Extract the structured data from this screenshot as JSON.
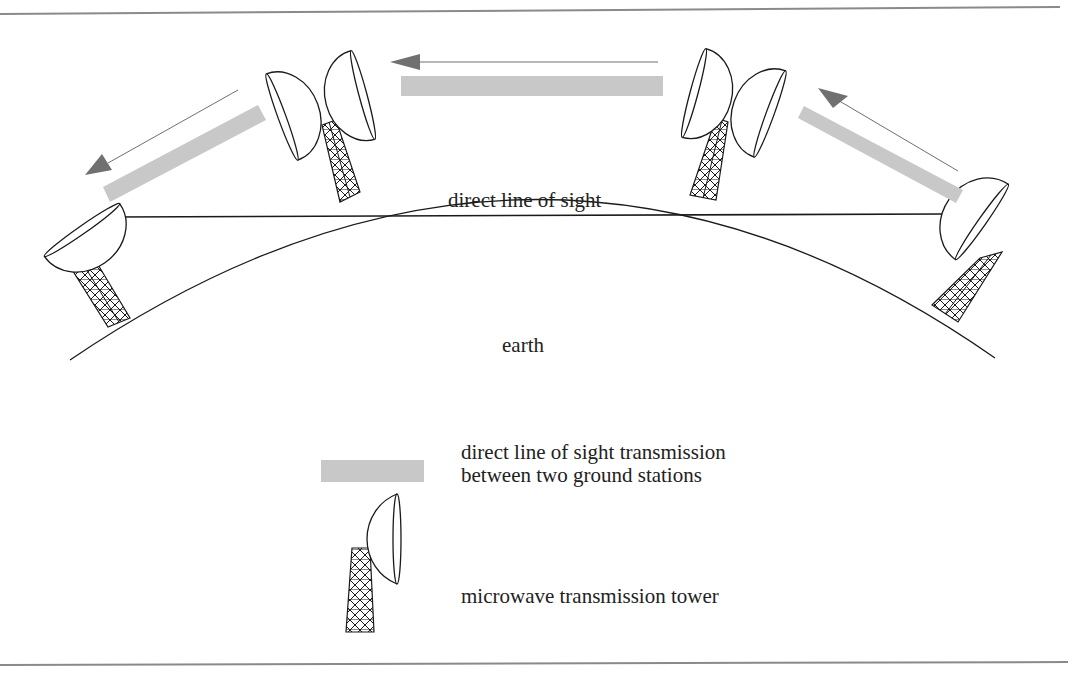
{
  "diagram": {
    "labels": {
      "line_of_sight": "direct line of sight",
      "earth": "earth"
    },
    "colors": {
      "border": "#8a8a8a",
      "beam": "#c8c8c8",
      "arrow": "#707070",
      "line": "#1a1a1a",
      "background": "#ffffff"
    },
    "towers": [
      {
        "id": "tower-1",
        "type": "end station",
        "dishes": 1,
        "position": "far left"
      },
      {
        "id": "tower-2",
        "type": "relay",
        "dishes": 2,
        "position": "left center"
      },
      {
        "id": "tower-3",
        "type": "relay",
        "dishes": 2,
        "position": "right center"
      },
      {
        "id": "tower-4",
        "type": "end station",
        "dishes": 1,
        "position": "far right"
      }
    ],
    "beams": [
      {
        "from": "tower-2",
        "to": "tower-1",
        "direction": "down-left"
      },
      {
        "from": "tower-3",
        "to": "tower-2",
        "direction": "left"
      },
      {
        "from": "tower-4",
        "to": "tower-3",
        "direction": "up-left"
      }
    ]
  },
  "legend": {
    "items": [
      {
        "symbol": "gray-beam",
        "line1": "direct line of sight transmission",
        "line2": "between two ground stations"
      },
      {
        "symbol": "tower",
        "line1": "microwave transmission tower"
      }
    ]
  }
}
